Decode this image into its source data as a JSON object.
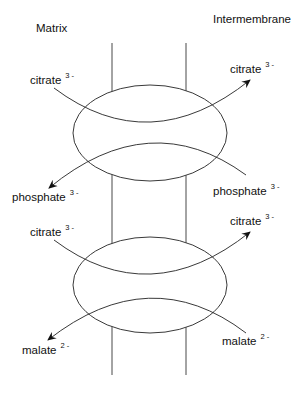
{
  "regions": {
    "left": "Matrix",
    "right": "Intermembrane"
  },
  "transporters": [
    {
      "influx": {
        "name": "citrate",
        "charge": "3 -"
      },
      "efflux_label": {
        "name": "citrate",
        "charge": "3 -"
      },
      "counter_in": {
        "name": "phosphate",
        "charge": "3 -"
      },
      "counter_out": {
        "name": "phosphate",
        "charge": "3 -"
      }
    },
    {
      "influx": {
        "name": "citrate",
        "charge": "3 -"
      },
      "efflux_label": {
        "name": "citrate",
        "charge": "3 -"
      },
      "counter_in": {
        "name": "malate",
        "charge": "2 -"
      },
      "counter_out": {
        "name": "malate",
        "charge": "2 -"
      }
    }
  ],
  "colors": {
    "stroke": "#222222",
    "background": "#ffffff"
  }
}
